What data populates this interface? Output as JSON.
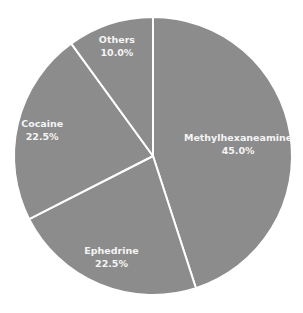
{
  "chart_data": {
    "type": "pie",
    "title": "",
    "start_angle": "12 o'clock",
    "direction": "clockwise",
    "slices": [
      {
        "label": "Methylhexaneamine",
        "value": 45.0,
        "display": "45.0%"
      },
      {
        "label": "Ephedrine",
        "value": 22.5,
        "display": "22.5%"
      },
      {
        "label": "Cocaine",
        "value": 22.5,
        "display": "22.5%"
      },
      {
        "label": "Others",
        "value": 10.0,
        "display": "10.0%"
      }
    ],
    "colors": {
      "slice_fill": "#8c8c8c",
      "separator": "#ffffff",
      "label_text": "#f4f4f4"
    },
    "legend": "none (labels inside slices)"
  }
}
